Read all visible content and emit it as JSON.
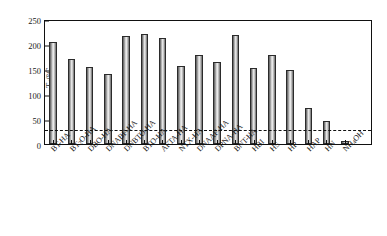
{
  "chart_data": {
    "type": "bar",
    "title": "",
    "xlabel": "",
    "ylabel": "Td/°C",
    "ylabel_main": "T",
    "ylabel_sub": "d",
    "ylabel_unit": "/°C",
    "ylim": [
      0,
      250
    ],
    "yticks": [
      0,
      50,
      100,
      150,
      200,
      250
    ],
    "ytick_labels": [
      "0",
      "50",
      "100",
      "150",
      "200",
      "250"
    ],
    "grid": false,
    "legend": "none",
    "categories": [
      "BT-HA",
      "BT2O-HA",
      "DBO-HA",
      "DNABF-HA",
      "DNBTO-HA",
      "BTO-HA",
      "AFTA-HA",
      "NTX-HA",
      "DNAAF-HA",
      "DPNA-HA",
      "BNT-HA",
      "HBI",
      "HS",
      "HP",
      "HAP",
      "HN",
      "NH4OH"
    ],
    "category_labels": [
      {
        "main": "BT-HA",
        "sub": "",
        "tail": ""
      },
      {
        "main": "BT",
        "sub": "2",
        "tail": "O-HA"
      },
      {
        "main": "DBO-HA",
        "sub": "",
        "tail": ""
      },
      {
        "main": "DNABF-HA",
        "sub": "",
        "tail": ""
      },
      {
        "main": "DNBTO-HA",
        "sub": "",
        "tail": ""
      },
      {
        "main": "BTO-HA",
        "sub": "",
        "tail": ""
      },
      {
        "main": "AFTA-HA",
        "sub": "",
        "tail": ""
      },
      {
        "main": "NTX-HA",
        "sub": "",
        "tail": ""
      },
      {
        "main": "DNAAF-HA",
        "sub": "",
        "tail": ""
      },
      {
        "main": "DPNA-HA",
        "sub": "",
        "tail": ""
      },
      {
        "main": "BNT-HA",
        "sub": "",
        "tail": ""
      },
      {
        "main": "HBI",
        "sub": "",
        "tail": ""
      },
      {
        "main": "HS",
        "sub": "",
        "tail": ""
      },
      {
        "main": "HP",
        "sub": "",
        "tail": ""
      },
      {
        "main": "HAP",
        "sub": "",
        "tail": ""
      },
      {
        "main": "HN",
        "sub": "",
        "tail": ""
      },
      {
        "main": "NH",
        "sub": "4",
        "tail": "OH"
      }
    ],
    "values": [
      204,
      171,
      155,
      140,
      217,
      221,
      213,
      156,
      178,
      164,
      218,
      152,
      178,
      148,
      72,
      46,
      6
    ],
    "annotations": [
      {
        "type": "hline",
        "value": 33,
        "style": "dashed",
        "color": "#111111"
      }
    ],
    "colors": {
      "bar_fill_light": "#f0f0f0",
      "bar_fill_mid": "#b9b9b9",
      "bar_fill_dark": "#5d5d5d",
      "bar_outline": "#2b2b2b",
      "axis": "#111111"
    }
  }
}
